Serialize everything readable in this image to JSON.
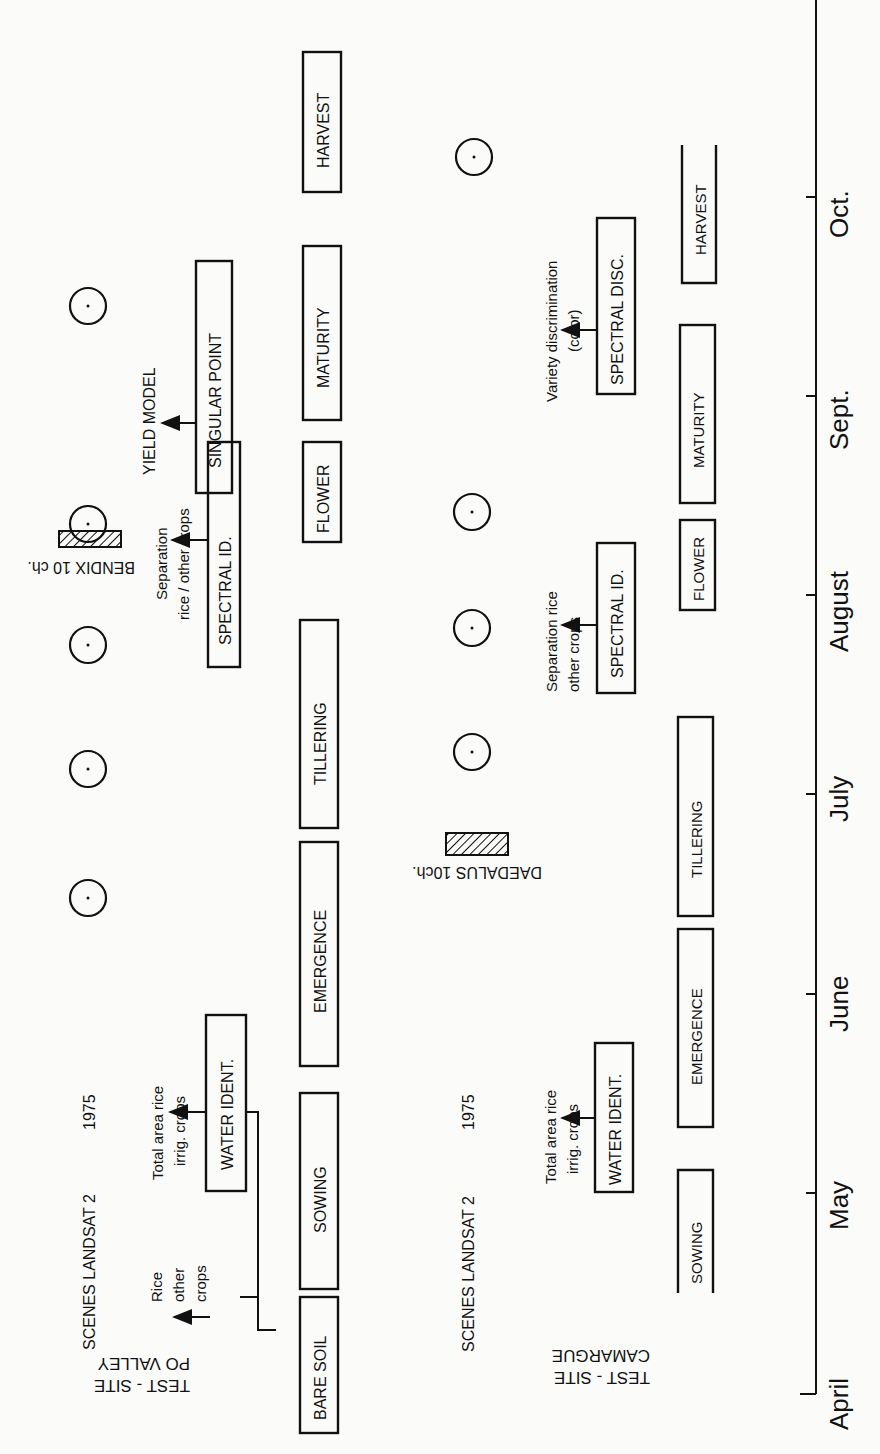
{
  "diagram": {
    "orientation": "rotated 90deg counter-clockwise; time axis runs bottom (April) to top (Oct.)",
    "axis": {
      "months": [
        "April",
        "May",
        "June",
        "July",
        "August",
        "Sept.",
        "Oct."
      ]
    },
    "po_valley": {
      "site_label_line1": "TEST - SITE",
      "site_label_line2": "PO VALLEY",
      "scenes_label": "SCENES LANDSAT 2",
      "scenes_year": "1975",
      "stages": [
        "BARE SOIL",
        "SOWING",
        "EMERGENCE",
        "TILLERING",
        "FLOWER",
        "MATURITY",
        "HARVEST"
      ],
      "analyses": {
        "water_ident": "WATER IDENT.",
        "water_note_line1": "Total area rice",
        "water_note_line2": "irrig.      crops",
        "rice_note_line1": "Rice",
        "rice_note_line2": "other",
        "rice_note_line3": "crops",
        "spectral_id": "SPECTRAL ID.",
        "spectral_note_line1": "Separation",
        "spectral_note_line2": "rice / other   crops",
        "singular_point": "SINGULAR POINT",
        "yield_model": "YIELD MODEL"
      },
      "sensor_label": "BENDIX 10 ch.",
      "landsat_passes": 5
    },
    "camargue": {
      "site_label_line1": "TEST - SITE",
      "site_label_line2": "CAMARGUE",
      "scenes_label": "SCENES LANDSAT 2",
      "scenes_year": "1975",
      "stages": [
        "SOWING",
        "EMERGENCE",
        "TILLERING",
        "FLOWER",
        "MATURITY",
        "HARVEST"
      ],
      "analyses": {
        "water_ident": "WATER IDENT.",
        "water_note_line1": "Total area rice",
        "water_note_line2": "irrig.     crops",
        "spectral_id": "SPECTRAL ID.",
        "spectral_note_line1": "Separation rice",
        "spectral_note_line2": "other   crops",
        "spectral_disc": "SPECTRAL DISC.",
        "disc_note_line1": "Variety discrimination",
        "disc_note_line2": "(color)"
      },
      "sensor_label": "DAEDALUS 10ch.",
      "landsat_passes": 4
    }
  }
}
